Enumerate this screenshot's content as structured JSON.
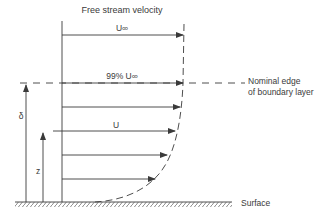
{
  "diagram": {
    "title": "Free stream velocity",
    "labels": {
      "u_inf": "U∞",
      "u_99": "99% U∞",
      "u": "U",
      "delta": "δ",
      "z": "z",
      "surface": "Surface",
      "edge_line1": "Nominal edge",
      "edge_line2": "of boundary layer"
    },
    "colors": {
      "line": "#3a3a3a",
      "text": "#3a3a3a",
      "background": "#ffffff"
    }
  }
}
